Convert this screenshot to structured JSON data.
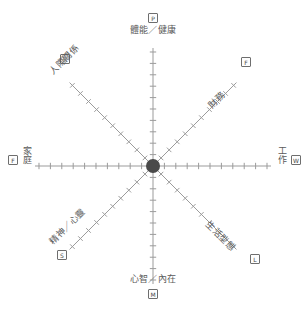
{
  "diagram": {
    "type": "wheel-of-life-axes",
    "title": "",
    "center": {
      "x": 153,
      "y": 166,
      "radius": 7,
      "color": "#4a4a4a"
    },
    "axis": {
      "length": 118,
      "ticks_per_arm": 10,
      "line_color": "#9b9b9b",
      "tick_color": "#9b9b9b"
    },
    "spokes": [
      {
        "id": "physical",
        "label": "體能／健康",
        "marker": "P",
        "direction": "north",
        "angle_deg": 90
      },
      {
        "id": "finance",
        "label": "財務",
        "marker": "F",
        "direction": "north-east",
        "angle_deg": 45
      },
      {
        "id": "work",
        "label": "工作",
        "marker": "W",
        "direction": "east",
        "angle_deg": 0
      },
      {
        "id": "lifestyle",
        "label": "生活型態",
        "marker": "L",
        "direction": "south-east",
        "angle_deg": -45
      },
      {
        "id": "mental",
        "label": "心智／內在",
        "marker": "M",
        "direction": "south",
        "angle_deg": -90
      },
      {
        "id": "spirit",
        "label": "精神／心靈",
        "marker": "S",
        "direction": "south-west",
        "angle_deg": -135
      },
      {
        "id": "family",
        "label": "家庭",
        "marker": "F",
        "direction": "west",
        "angle_deg": 180
      },
      {
        "id": "relations",
        "label": "人際關係",
        "marker": "R",
        "direction": "north-west",
        "angle_deg": 135
      }
    ],
    "colors": {
      "background": "#ffffff",
      "line": "#9b9b9b",
      "hub": "#4a4a4a",
      "text": "#5a5a5a",
      "marker_border": "#6e6e6e"
    }
  }
}
